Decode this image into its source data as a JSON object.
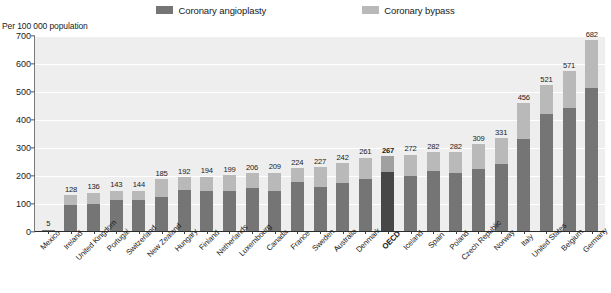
{
  "legend": {
    "items": [
      {
        "label": "Coronary angioplasty",
        "color": "#757575",
        "key": "angioplasty"
      },
      {
        "label": "Coronary bypass",
        "color": "#b9b9b9",
        "key": "bypass"
      }
    ]
  },
  "axis": {
    "y_title": "Per 100 000 population",
    "y_ticks": [
      0,
      100,
      200,
      300,
      400,
      500,
      600,
      700
    ],
    "y_min": 0,
    "y_max": 700
  },
  "chart_data": {
    "type": "bar",
    "title": "",
    "subtitle": "",
    "xlabel": "",
    "ylabel": "Per 100 000 population",
    "ylim": [
      0,
      700
    ],
    "grid": true,
    "stacked": true,
    "legend_position": "top",
    "highlight_category": "OECD",
    "categories": [
      "Mexico",
      "Ireland",
      "United Kingdom",
      "Portugal",
      "Switzerland",
      "New Zealand",
      "Hungary",
      "Finland",
      "Netherlands",
      "Luxembourg",
      "Canada",
      "France",
      "Sweden",
      "Australia",
      "Denmark",
      "OECD",
      "Iceland",
      "Spain",
      "Poland",
      "Czech Republic",
      "Norway",
      "Italy",
      "United States",
      "Belgium",
      "Germany"
    ],
    "totals": [
      5,
      128,
      136,
      143,
      144,
      185,
      192,
      194,
      199,
      206,
      209,
      224,
      227,
      242,
      261,
      267,
      272,
      282,
      282,
      309,
      331,
      456,
      521,
      571,
      682
    ],
    "series": [
      {
        "name": "Coronary angioplasty",
        "color": "#757575",
        "values": [
          4,
          94,
          96,
          112,
          112,
          122,
          146,
          142,
          144,
          152,
          142,
          176,
          158,
          172,
          184,
          210,
          196,
          216,
          206,
          222,
          238,
          330,
          418,
          440,
          512
        ]
      },
      {
        "name": "Coronary bypass",
        "color": "#b9b9b9",
        "values": [
          1,
          34,
          40,
          31,
          32,
          63,
          46,
          52,
          55,
          54,
          67,
          48,
          69,
          70,
          77,
          57,
          76,
          66,
          76,
          87,
          93,
          126,
          103,
          131,
          170
        ]
      }
    ],
    "value_labels": [
      "5",
      "128",
      "136",
      "143",
      "144",
      "185",
      "192",
      "194",
      "199",
      "206",
      "209",
      "224",
      "227",
      "242",
      "261",
      "267",
      "272",
      "282",
      "282",
      "309",
      "331",
      "456",
      "521",
      "571",
      "682"
    ]
  },
  "colors": {
    "plot_background": "#eeeeee",
    "gridline": "#ffffff",
    "axis": "#2b2b2b",
    "angioplasty": "#757575",
    "bypass": "#b9b9b9",
    "highlight_angioplasty": "#474747",
    "highlight_bypass": "#a0a0a0"
  }
}
